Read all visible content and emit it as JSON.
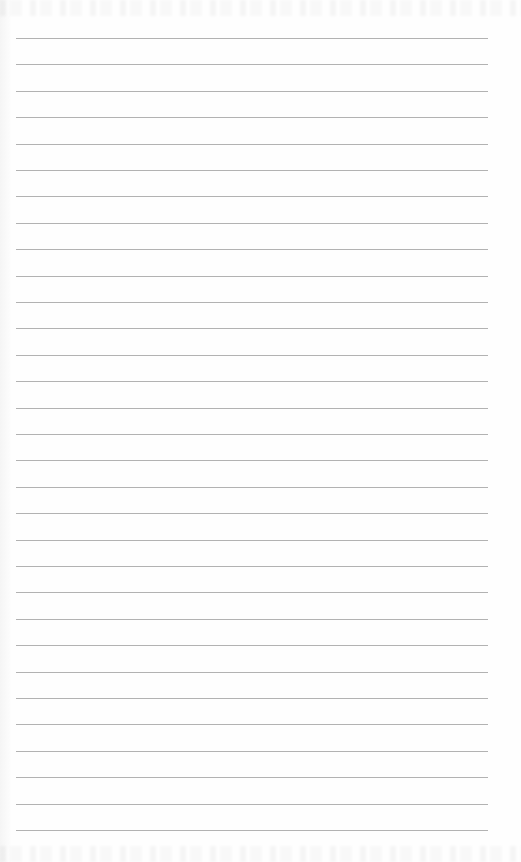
{
  "page": {
    "type": "ruled-notebook-page",
    "background_color": "#fefefe",
    "rule_color": "#aaaaaa",
    "rules": {
      "count": 31,
      "first_y": 38,
      "spacing": 26.4,
      "x_start": 16,
      "x_end": 488
    },
    "text": ""
  }
}
